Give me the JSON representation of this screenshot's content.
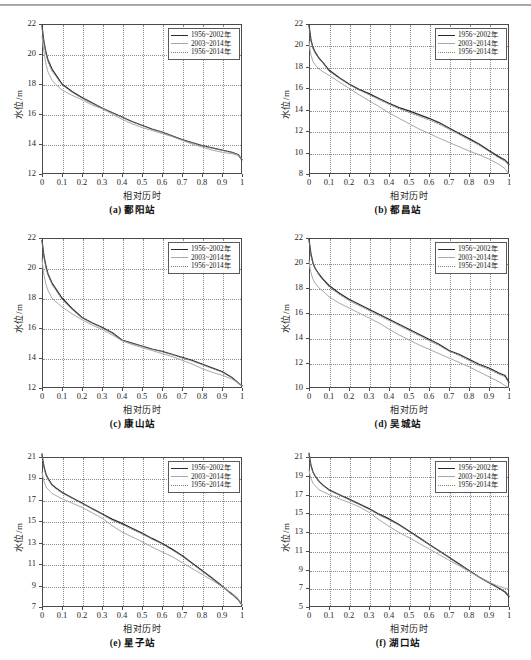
{
  "figure": {
    "axis_x_label": "相对历时",
    "axis_y_label": "水位/m",
    "legend": [
      {
        "key": "line-solid-dark",
        "label": "1956~2002年",
        "color": "#2a2a2a"
      },
      {
        "key": "line-solid-light",
        "label": "2003~2014年",
        "color": "#a8a8a8"
      },
      {
        "key": "line-dotted",
        "label": "1956~2014年",
        "color": "#7d7d7d"
      }
    ],
    "footer_note": ""
  },
  "chart_data": [
    {
      "type": "line",
      "panel_id": "a",
      "title": "(a) 鄱阳站",
      "station": "鄱阳站",
      "xlabel": "相对历时",
      "ylabel": "水位/m",
      "xlim": [
        0,
        1
      ],
      "ylim": [
        12,
        22
      ],
      "xticks": [
        "0",
        "0.1",
        "0.2",
        "0.3",
        "0.4",
        "0.5",
        "0.6",
        "0.7",
        "0.8",
        "0.9",
        "1"
      ],
      "yticks": [
        "12",
        "14",
        "16",
        "18",
        "20",
        "22"
      ],
      "grid": true,
      "legend_position": "top-right",
      "x": [
        0,
        0.005,
        0.01,
        0.02,
        0.03,
        0.05,
        0.07,
        0.1,
        0.15,
        0.2,
        0.25,
        0.3,
        0.35,
        0.4,
        0.45,
        0.5,
        0.55,
        0.6,
        0.65,
        0.7,
        0.75,
        0.8,
        0.85,
        0.9,
        0.95,
        0.98,
        1
      ],
      "series": [
        {
          "name": "1956~2002年",
          "values": [
            21.9,
            21.3,
            20.8,
            20.1,
            19.6,
            19.0,
            18.6,
            18.0,
            17.5,
            17.1,
            16.75,
            16.4,
            16.1,
            15.8,
            15.5,
            15.25,
            15.0,
            14.8,
            14.55,
            14.3,
            14.1,
            13.9,
            13.75,
            13.6,
            13.45,
            13.3,
            12.95
          ]
        },
        {
          "name": "2003~2014年",
          "values": [
            21.2,
            20.6,
            20.1,
            19.3,
            18.8,
            18.25,
            17.95,
            17.6,
            17.25,
            16.95,
            16.6,
            16.35,
            16.0,
            15.65,
            15.35,
            15.1,
            14.9,
            14.7,
            14.5,
            14.25,
            14.0,
            13.8,
            13.6,
            13.45,
            13.35,
            13.25,
            13.0
          ]
        },
        {
          "name": "1956~2014年",
          "values": [
            21.8,
            21.2,
            20.7,
            20.0,
            19.5,
            18.85,
            18.5,
            17.95,
            17.45,
            17.05,
            16.7,
            16.4,
            16.1,
            15.78,
            15.48,
            15.22,
            14.98,
            14.78,
            14.53,
            14.28,
            14.07,
            13.88,
            13.72,
            13.57,
            13.43,
            13.29,
            12.97
          ]
        }
      ]
    },
    {
      "type": "line",
      "panel_id": "b",
      "title": "(b) 都昌站",
      "station": "都昌站",
      "xlabel": "相对历时",
      "ylabel": "水位/m",
      "xlim": [
        0,
        1
      ],
      "ylim": [
        8,
        22
      ],
      "xticks": [
        "0",
        "0.1",
        "0.2",
        "0.3",
        "0.4",
        "0.5",
        "0.6",
        "0.7",
        "0.8",
        "0.9",
        "1"
      ],
      "yticks": [
        "8",
        "10",
        "12",
        "14",
        "16",
        "18",
        "20",
        "22"
      ],
      "grid": true,
      "legend_position": "top-right",
      "x": [
        0,
        0.005,
        0.01,
        0.02,
        0.03,
        0.05,
        0.07,
        0.1,
        0.15,
        0.2,
        0.25,
        0.3,
        0.35,
        0.4,
        0.45,
        0.5,
        0.55,
        0.6,
        0.65,
        0.7,
        0.75,
        0.8,
        0.85,
        0.9,
        0.95,
        0.98,
        1
      ],
      "series": [
        {
          "name": "1956~2002年",
          "values": [
            21.9,
            21.2,
            20.5,
            19.8,
            19.4,
            18.8,
            18.4,
            17.7,
            17.0,
            16.4,
            15.9,
            15.5,
            15.05,
            14.6,
            14.2,
            13.9,
            13.55,
            13.2,
            12.8,
            12.3,
            11.8,
            11.3,
            10.8,
            10.2,
            9.6,
            9.3,
            8.9
          ]
        },
        {
          "name": "2003~2014年",
          "values": [
            20.4,
            19.6,
            19.1,
            18.5,
            18.2,
            17.8,
            17.55,
            17.2,
            16.6,
            16.0,
            15.4,
            14.85,
            14.3,
            13.7,
            13.2,
            12.7,
            12.2,
            11.8,
            11.35,
            10.95,
            10.55,
            10.15,
            9.8,
            9.4,
            8.9,
            8.5,
            8.0
          ]
        },
        {
          "name": "1956~2014年",
          "values": [
            21.8,
            21.0,
            20.4,
            19.7,
            19.3,
            18.75,
            18.35,
            17.6,
            16.95,
            16.35,
            15.85,
            15.4,
            14.95,
            14.5,
            14.1,
            13.75,
            13.4,
            13.05,
            12.65,
            12.2,
            11.7,
            11.2,
            10.7,
            10.1,
            9.5,
            9.2,
            8.8
          ]
        }
      ]
    },
    {
      "type": "line",
      "panel_id": "c",
      "title": "(c) 康山站",
      "station": "康山站",
      "xlabel": "相对历时",
      "ylabel": "水位/m",
      "xlim": [
        0,
        1
      ],
      "ylim": [
        12,
        22
      ],
      "xticks": [
        "0",
        "0.1",
        "0.2",
        "0.3",
        "0.4",
        "0.5",
        "0.6",
        "0.7",
        "0.8",
        "0.9",
        "1"
      ],
      "yticks": [
        "12",
        "14",
        "16",
        "18",
        "20",
        "22"
      ],
      "grid": true,
      "legend_position": "top-right",
      "x": [
        0,
        0.005,
        0.01,
        0.02,
        0.03,
        0.05,
        0.07,
        0.1,
        0.15,
        0.2,
        0.25,
        0.3,
        0.35,
        0.4,
        0.45,
        0.5,
        0.55,
        0.6,
        0.65,
        0.7,
        0.75,
        0.8,
        0.85,
        0.9,
        0.95,
        0.98,
        1
      ],
      "series": [
        {
          "name": "1956~2002年",
          "values": [
            21.85,
            21.3,
            20.8,
            20.1,
            19.6,
            19.0,
            18.6,
            18.0,
            17.3,
            16.7,
            16.35,
            16.05,
            15.7,
            15.2,
            15.0,
            14.8,
            14.6,
            14.45,
            14.25,
            14.05,
            13.85,
            13.6,
            13.35,
            13.1,
            12.7,
            12.35,
            12.15
          ]
        },
        {
          "name": "2003~2014年",
          "values": [
            20.6,
            20.0,
            19.5,
            18.9,
            18.5,
            18.0,
            17.75,
            17.4,
            16.95,
            16.55,
            16.2,
            15.9,
            15.55,
            15.15,
            14.9,
            14.7,
            14.5,
            14.3,
            14.1,
            13.85,
            13.6,
            13.3,
            13.05,
            12.85,
            12.6,
            12.35,
            12.15
          ]
        },
        {
          "name": "1956~2014年",
          "values": [
            21.8,
            21.2,
            20.7,
            20.0,
            19.55,
            18.9,
            18.5,
            17.9,
            17.25,
            16.67,
            16.32,
            16.0,
            15.66,
            15.18,
            14.97,
            14.78,
            14.58,
            14.42,
            14.22,
            14.0,
            13.8,
            13.55,
            13.3,
            13.05,
            12.68,
            12.35,
            12.15
          ]
        }
      ]
    },
    {
      "type": "line",
      "panel_id": "d",
      "title": "(d) 吴城站",
      "station": "吴城站",
      "xlabel": "相对历时",
      "ylabel": "水位/m",
      "xlim": [
        0,
        1
      ],
      "ylim": [
        10,
        22
      ],
      "xticks": [
        "0",
        "0.1",
        "0.2",
        "0.3",
        "0.4",
        "0.5",
        "0.6",
        "0.7",
        "0.8",
        "0.9",
        "1"
      ],
      "yticks": [
        "10",
        "12",
        "14",
        "16",
        "18",
        "20",
        "22"
      ],
      "grid": true,
      "legend_position": "top-right",
      "x": [
        0,
        0.005,
        0.01,
        0.02,
        0.03,
        0.05,
        0.07,
        0.1,
        0.15,
        0.2,
        0.25,
        0.3,
        0.35,
        0.4,
        0.45,
        0.5,
        0.55,
        0.6,
        0.65,
        0.7,
        0.75,
        0.8,
        0.85,
        0.9,
        0.95,
        0.98,
        1
      ],
      "series": [
        {
          "name": "1956~2002年",
          "values": [
            21.9,
            21.3,
            20.7,
            20.0,
            19.6,
            19.1,
            18.7,
            18.2,
            17.6,
            17.1,
            16.7,
            16.3,
            15.9,
            15.5,
            15.1,
            14.7,
            14.3,
            13.9,
            13.5,
            13.0,
            12.7,
            12.3,
            11.9,
            11.6,
            11.2,
            11.0,
            10.45
          ]
        },
        {
          "name": "2003~2014年",
          "values": [
            20.2,
            19.6,
            19.2,
            18.7,
            18.4,
            18.0,
            17.75,
            17.3,
            16.8,
            16.4,
            16.0,
            15.6,
            15.2,
            14.7,
            14.25,
            13.85,
            13.45,
            13.1,
            12.75,
            12.4,
            12.05,
            11.7,
            11.3,
            10.9,
            10.5,
            10.2,
            10.05
          ]
        },
        {
          "name": "1956~2014年",
          "values": [
            21.8,
            21.2,
            20.6,
            19.95,
            19.55,
            19.05,
            18.65,
            18.1,
            17.5,
            17.0,
            16.6,
            16.2,
            15.8,
            15.4,
            15.0,
            14.6,
            14.2,
            13.8,
            13.4,
            12.95,
            12.6,
            12.2,
            11.8,
            11.5,
            11.1,
            10.9,
            10.4
          ]
        }
      ]
    },
    {
      "type": "line",
      "panel_id": "e",
      "title": "(e) 星子站",
      "station": "星子站",
      "xlabel": "相对历时",
      "ylabel": "水位/m",
      "xlim": [
        0,
        1
      ],
      "ylim": [
        7,
        21
      ],
      "xticks": [
        "0",
        "0.1",
        "0.2",
        "0.3",
        "0.4",
        "0.5",
        "0.6",
        "0.7",
        "0.8",
        "0.9",
        "1"
      ],
      "yticks": [
        "7",
        "9",
        "11",
        "13",
        "15",
        "17",
        "19",
        "21"
      ],
      "grid": true,
      "legend_position": "top-right",
      "x": [
        0,
        0.005,
        0.01,
        0.02,
        0.03,
        0.05,
        0.07,
        0.1,
        0.15,
        0.2,
        0.25,
        0.3,
        0.35,
        0.4,
        0.45,
        0.5,
        0.55,
        0.6,
        0.65,
        0.7,
        0.75,
        0.8,
        0.85,
        0.9,
        0.95,
        0.98,
        1
      ],
      "series": [
        {
          "name": "1956~2002年",
          "values": [
            21.3,
            20.6,
            20.1,
            19.4,
            19.0,
            18.4,
            18.1,
            17.7,
            17.2,
            16.7,
            16.2,
            15.7,
            15.2,
            14.8,
            14.35,
            13.9,
            13.4,
            12.95,
            12.4,
            11.8,
            11.1,
            10.4,
            9.7,
            8.95,
            8.2,
            7.7,
            7.2
          ]
        },
        {
          "name": "2003~2014年",
          "values": [
            19.6,
            19.1,
            18.7,
            18.2,
            18.0,
            17.6,
            17.4,
            17.1,
            16.7,
            16.3,
            15.8,
            15.3,
            14.6,
            14.0,
            13.55,
            13.1,
            12.6,
            12.15,
            11.7,
            11.15,
            10.6,
            10.05,
            9.5,
            8.9,
            8.3,
            7.8,
            7.2
          ]
        },
        {
          "name": "1956~2014年",
          "values": [
            21.2,
            20.5,
            20.0,
            19.3,
            18.95,
            18.35,
            18.05,
            17.65,
            17.15,
            16.65,
            16.15,
            15.65,
            15.1,
            14.7,
            14.25,
            13.82,
            13.33,
            12.88,
            12.33,
            11.75,
            11.05,
            10.35,
            9.65,
            8.92,
            8.2,
            7.7,
            7.2
          ]
        }
      ]
    },
    {
      "type": "line",
      "panel_id": "f",
      "title": "(f) 湖口站",
      "station": "湖口站",
      "xlabel": "相对历时",
      "ylabel": "水位/m",
      "xlim": [
        0,
        1
      ],
      "ylim": [
        5,
        21
      ],
      "xticks": [
        "0",
        "0.1",
        "0.2",
        "0.3",
        "0.4",
        "0.5",
        "0.6",
        "0.7",
        "0.8",
        "0.9",
        "1"
      ],
      "yticks": [
        "5",
        "7",
        "9",
        "11",
        "13",
        "15",
        "17",
        "19",
        "21"
      ],
      "grid": true,
      "legend_position": "top-right",
      "x": [
        0,
        0.005,
        0.01,
        0.02,
        0.03,
        0.05,
        0.07,
        0.1,
        0.15,
        0.2,
        0.25,
        0.3,
        0.35,
        0.4,
        0.45,
        0.5,
        0.55,
        0.6,
        0.65,
        0.7,
        0.75,
        0.8,
        0.85,
        0.9,
        0.95,
        0.98,
        1
      ],
      "series": [
        {
          "name": "1956~2002年",
          "values": [
            21.4,
            20.7,
            20.1,
            19.4,
            19.0,
            18.4,
            18.0,
            17.5,
            17.0,
            16.5,
            16.0,
            15.5,
            14.9,
            14.4,
            13.8,
            13.1,
            12.4,
            11.7,
            11.0,
            10.3,
            9.6,
            8.9,
            8.2,
            7.6,
            7.0,
            6.6,
            6.1
          ]
        },
        {
          "name": "2003~2014年",
          "values": [
            19.6,
            19.1,
            18.7,
            18.2,
            17.95,
            17.5,
            17.3,
            17.0,
            16.55,
            16.15,
            15.7,
            15.1,
            14.3,
            13.6,
            12.95,
            12.4,
            11.8,
            11.2,
            10.6,
            10.0,
            9.4,
            8.8,
            8.2,
            7.65,
            7.2,
            7.0,
            7.0
          ]
        },
        {
          "name": "1956~2014年",
          "values": [
            21.3,
            20.6,
            20.0,
            19.35,
            18.95,
            18.35,
            17.95,
            17.45,
            16.95,
            16.45,
            15.95,
            15.42,
            14.82,
            14.3,
            13.72,
            13.05,
            12.35,
            11.65,
            10.95,
            10.25,
            9.55,
            8.87,
            8.2,
            7.62,
            7.05,
            6.7,
            6.2
          ]
        }
      ]
    }
  ]
}
